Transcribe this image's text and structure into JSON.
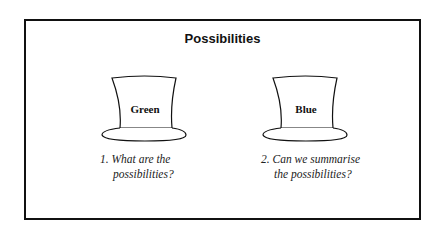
{
  "title": "Possibilities",
  "hats": [
    {
      "label": "Green",
      "caption_line1": "1. What are the",
      "caption_line2": "possibilities?"
    },
    {
      "label": "Blue",
      "caption_line1": "2. Can we summarise",
      "caption_line2": "the possibilities?"
    }
  ],
  "colors": {
    "stroke": "#111111",
    "background": "#ffffff"
  }
}
